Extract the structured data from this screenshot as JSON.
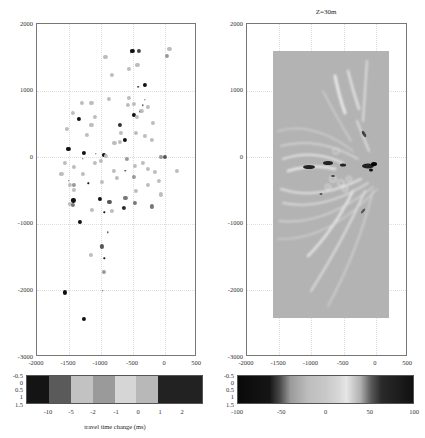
{
  "chart_data": [
    {
      "type": "scatter",
      "title": "",
      "xlabel": "",
      "ylabel": "",
      "xlim": [
        -2000,
        500
      ],
      "ylim": [
        -3000,
        2000
      ],
      "x_ticks": [
        "-2000",
        "-1500",
        "-1000",
        "-500",
        "0",
        "500"
      ],
      "y_ticks": [
        "2000",
        "1000",
        "0",
        "-1000",
        "-2000",
        "-3000"
      ],
      "grid": true,
      "points": [
        {
          "x": -930,
          "y": 1510,
          "c": "#bdbdbd"
        },
        {
          "x": -830,
          "y": 1240,
          "c": "#bdbdbd"
        },
        {
          "x": -510,
          "y": 1590,
          "c": "#111"
        },
        {
          "x": -410,
          "y": 1590,
          "c": "#444"
        },
        {
          "x": 70,
          "y": 1630,
          "c": "#bdbdbd"
        },
        {
          "x": 30,
          "y": 1520,
          "c": "#999"
        },
        {
          "x": -570,
          "y": 1330,
          "c": "#bdbdbd"
        },
        {
          "x": -430,
          "y": 1380,
          "c": "#bdbdbd"
        },
        {
          "x": -310,
          "y": 1080,
          "c": "#111"
        },
        {
          "x": -420,
          "y": 1050,
          "c": "#111",
          "s": 1.2
        },
        {
          "x": -880,
          "y": 870,
          "c": "#bdbdbd"
        },
        {
          "x": -1300,
          "y": 820,
          "c": "#bdbdbd"
        },
        {
          "x": -1150,
          "y": 810,
          "c": "#bdbdbd"
        },
        {
          "x": -570,
          "y": 890,
          "c": "#bdbdbd"
        },
        {
          "x": -480,
          "y": 800,
          "c": "#bdbdbd"
        },
        {
          "x": -580,
          "y": 780,
          "c": "#bdbdbd"
        },
        {
          "x": -370,
          "y": 700,
          "c": "#bdbdbd"
        },
        {
          "x": -270,
          "y": 760,
          "c": "#bdbdbd"
        },
        {
          "x": -1440,
          "y": 660,
          "c": "#bdbdbd"
        },
        {
          "x": -1090,
          "y": 600,
          "c": "#bdbdbd"
        },
        {
          "x": -1350,
          "y": 570,
          "c": "#111"
        },
        {
          "x": -490,
          "y": 640,
          "c": "#111"
        },
        {
          "x": -440,
          "y": 600,
          "c": "#bdbdbd"
        },
        {
          "x": -1150,
          "y": 490,
          "c": "#bdbdbd"
        },
        {
          "x": -710,
          "y": 490,
          "c": "#333"
        },
        {
          "x": -1530,
          "y": 430,
          "c": "#bdbdbd"
        },
        {
          "x": -1220,
          "y": 340,
          "c": "#bdbdbd"
        },
        {
          "x": -690,
          "y": 360,
          "c": "#bdbdbd"
        },
        {
          "x": -460,
          "y": 370,
          "c": "#bdbdbd"
        },
        {
          "x": -320,
          "y": 320,
          "c": "#bdbdbd"
        },
        {
          "x": -190,
          "y": 510,
          "c": "#bdbdbd"
        },
        {
          "x": -630,
          "y": 260,
          "c": "#111"
        },
        {
          "x": -790,
          "y": 220,
          "c": "#bdbdbd"
        },
        {
          "x": -700,
          "y": 230,
          "c": "#bdbdbd"
        },
        {
          "x": -210,
          "y": 260,
          "c": "#bdbdbd"
        },
        {
          "x": -1510,
          "y": 130,
          "c": "#111"
        },
        {
          "x": -1270,
          "y": 70,
          "c": "#111"
        },
        {
          "x": -960,
          "y": 30,
          "c": "#111"
        },
        {
          "x": -920,
          "y": 20,
          "c": "#bdbdbd"
        },
        {
          "x": -70,
          "y": 0,
          "c": "#999"
        },
        {
          "x": 0,
          "y": 0,
          "c": "#555"
        },
        {
          "x": -590,
          "y": -30,
          "c": "#999"
        },
        {
          "x": -1570,
          "y": -90,
          "c": "#bdbdbd"
        },
        {
          "x": -1420,
          "y": -140,
          "c": "#bdbdbd"
        },
        {
          "x": -1090,
          "y": -90,
          "c": "#bdbdbd"
        },
        {
          "x": -1000,
          "y": -60,
          "c": "#bdbdbd"
        },
        {
          "x": -470,
          "y": -130,
          "c": "#bdbdbd"
        },
        {
          "x": -350,
          "y": -80,
          "c": "#bdbdbd"
        },
        {
          "x": -270,
          "y": -180,
          "c": "#bdbdbd"
        },
        {
          "x": -800,
          "y": -210,
          "c": "#bdbdbd"
        },
        {
          "x": -160,
          "y": -220,
          "c": "#bdbdbd"
        },
        {
          "x": 190,
          "y": -200,
          "c": "#bdbdbd"
        },
        {
          "x": -1620,
          "y": -250,
          "c": "#bdbdbd"
        },
        {
          "x": -1280,
          "y": -250,
          "c": "#bdbdbd"
        },
        {
          "x": -750,
          "y": -310,
          "c": "#bdbdbd"
        },
        {
          "x": -490,
          "y": -300,
          "c": "#999"
        },
        {
          "x": -980,
          "y": -370,
          "c": "#bdbdbd"
        },
        {
          "x": -90,
          "y": -350,
          "c": "#bdbdbd"
        },
        {
          "x": -1490,
          "y": -420,
          "c": "#bdbdbd"
        },
        {
          "x": -1420,
          "y": -410,
          "c": "#999"
        },
        {
          "x": -1420,
          "y": -490,
          "c": "#bdbdbd"
        },
        {
          "x": -460,
          "y": -500,
          "c": "#bdbdbd"
        },
        {
          "x": -270,
          "y": -420,
          "c": "#bdbdbd"
        },
        {
          "x": -60,
          "y": -560,
          "c": "#bdbdbd"
        },
        {
          "x": -1430,
          "y": -650,
          "c": "#111"
        },
        {
          "x": -1020,
          "y": -630,
          "c": "#111"
        },
        {
          "x": -870,
          "y": -670,
          "c": "#555"
        },
        {
          "x": -620,
          "y": -610,
          "c": "#777"
        },
        {
          "x": -470,
          "y": -690,
          "c": "#777"
        },
        {
          "x": -1490,
          "y": -700,
          "c": "#bdbdbd"
        },
        {
          "x": -1440,
          "y": -720,
          "c": "#777"
        },
        {
          "x": -1140,
          "y": -790,
          "c": "#bdbdbd"
        },
        {
          "x": -830,
          "y": -810,
          "c": "#bdbdbd"
        },
        {
          "x": -640,
          "y": -760,
          "c": "#333"
        },
        {
          "x": -210,
          "y": -740,
          "c": "#777"
        },
        {
          "x": -1330,
          "y": -970,
          "c": "#111"
        },
        {
          "x": -990,
          "y": -1340,
          "c": "#555"
        },
        {
          "x": -1160,
          "y": -1470,
          "c": "#bdbdbd"
        },
        {
          "x": -950,
          "y": -1720,
          "c": "#999"
        },
        {
          "x": -1560,
          "y": -2030,
          "c": "#111"
        },
        {
          "x": -1270,
          "y": -2430,
          "c": "#111"
        }
      ],
      "colorbar": {
        "tick_labels": [
          "-10",
          "-5",
          "-2",
          "-1",
          "0",
          "1",
          "2"
        ],
        "y_labels": [
          "-0.5",
          "0",
          "0.5",
          "1",
          "1.5"
        ],
        "segments": [
          "#141414",
          "#5a5a5a",
          "#c2c2c2",
          "#9a9a9a",
          "#d6d6d6",
          "#b8b8b8",
          "#222222",
          "#222222"
        ],
        "label": "travel time change (ms)"
      }
    },
    {
      "type": "heatmap",
      "title": "Z=30m",
      "xlim": [
        -2000,
        500
      ],
      "ylim": [
        -3000,
        2000
      ],
      "x_ticks": [
        "-2000",
        "-1500",
        "-1000",
        "-500",
        "0",
        "500"
      ],
      "y_ticks": [
        "2000",
        "1000",
        "0",
        "-1000",
        "-2000",
        "-3000"
      ],
      "data_extent": {
        "x": [
          -1600,
          200
        ],
        "y": [
          -2400,
          1600
        ]
      },
      "grid": true,
      "colorbar": {
        "tick_labels": [
          "-100",
          "-50",
          "0",
          "50",
          "100"
        ],
        "y_labels": [
          "-0.5",
          "0",
          "0.5",
          "1",
          "1.5"
        ],
        "range": [
          -100,
          100
        ]
      }
    }
  ],
  "left": {
    "y_ticks": [
      "2000",
      "1000",
      "0",
      "-1000",
      "-2000",
      "-3000"
    ],
    "x_ticks": [
      "-2000",
      "-1500",
      "-1000",
      "-500",
      "0",
      "500"
    ],
    "cbar_x_ticks": [
      "-10",
      "-5",
      "-2",
      "-1",
      "0",
      "1",
      "2"
    ],
    "cbar_y_ticks": [
      "-0.5",
      "0",
      "0.5",
      "1",
      "1.5"
    ],
    "cbar_label": "travel time change (ms)"
  },
  "right": {
    "title": "Z=30m",
    "y_ticks": [
      "2000",
      "1000",
      "0",
      "-1000",
      "-2000",
      "-3000"
    ],
    "x_ticks": [
      "-2000",
      "-1500",
      "-1000",
      "-500",
      "0",
      "500"
    ],
    "cbar_x_ticks": [
      "-100",
      "-50",
      "0",
      "50",
      "100"
    ],
    "cbar_y_ticks": [
      "-0.5",
      "0",
      "0.5",
      "1",
      "1.5"
    ]
  }
}
